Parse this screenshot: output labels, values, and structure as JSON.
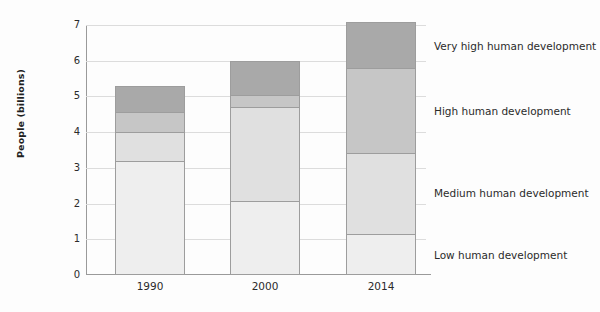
{
  "chart_data": {
    "type": "bar",
    "subtype": "stacked-bar",
    "title": "",
    "xlabel": "",
    "ylabel": "People (billions)",
    "ylim": [
      0,
      7
    ],
    "yticks": [
      0,
      1,
      2,
      3,
      4,
      5,
      6,
      7
    ],
    "ytick_labels": [
      "0",
      "1",
      "2",
      "3",
      "4",
      "5",
      "6",
      "7"
    ],
    "grid": true,
    "grid_axis": "y",
    "legend_position": "right-inline",
    "categories": [
      "1990",
      "2000",
      "2014"
    ],
    "series": [
      {
        "name": "Low human development",
        "color": "#eeeeee",
        "values": [
          3.17,
          2.05,
          1.12
        ]
      },
      {
        "name": "Medium human development",
        "color": "#e0e0e0",
        "values": [
          0.82,
          2.63,
          2.28
        ]
      },
      {
        "name": "High human development",
        "color": "#c6c6c6",
        "values": [
          0.56,
          0.34,
          2.37
        ]
      },
      {
        "name": "Very high human development",
        "color": "#a9a9a9",
        "values": [
          0.71,
          0.94,
          1.3
        ]
      }
    ],
    "totals": [
      5.26,
      5.96,
      7.07
    ],
    "annotations": []
  },
  "axis": {
    "y_title": "People (billions)",
    "y_ticks": [
      "7",
      "6",
      "5",
      "4",
      "3",
      "2",
      "1",
      "0"
    ],
    "x_ticks": [
      "1990",
      "2000",
      "2014"
    ]
  },
  "legend": {
    "items": [
      {
        "label": "Very high human development",
        "color": "#a9a9a9"
      },
      {
        "label": "High human development",
        "color": "#c6c6c6"
      },
      {
        "label": "Medium human development",
        "color": "#e0e0e0"
      },
      {
        "label": "Low human development",
        "color": "#eeeeee"
      }
    ]
  },
  "colors": {
    "background": "#fdfdfd",
    "axis": "#9a9a9a",
    "grid": "#dcdcdc",
    "text": "#2b2b2b",
    "segment_border": "#9d9d9d"
  }
}
